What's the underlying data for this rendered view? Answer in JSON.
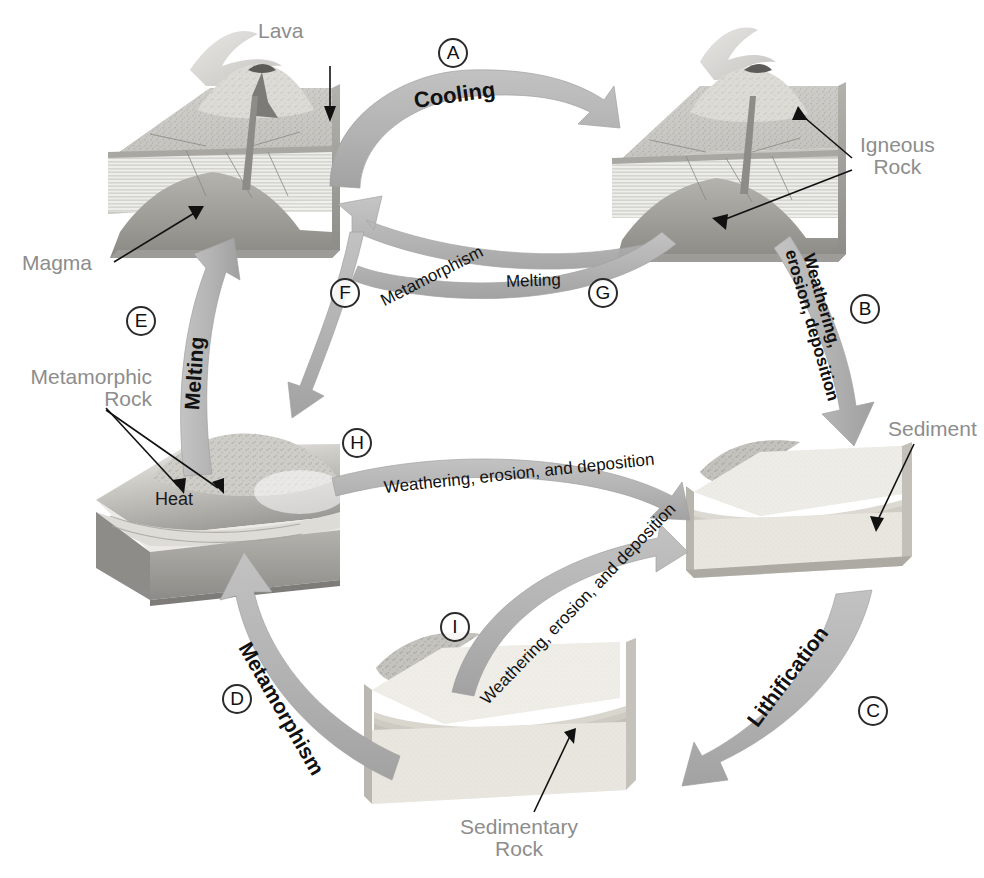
{
  "diagram": {
    "background": "#ffffff",
    "arrow_color": "#b3b3b3",
    "arrow_color_dark": "#9a9a9a",
    "label_gray": "#8d8d8d",
    "label_black": "#1a1a1a"
  },
  "blocks": [
    {
      "id": "igneous-volcano-left",
      "label": "",
      "position": "top-left"
    },
    {
      "id": "igneous-volcano-right",
      "label": "Igneous Rock",
      "position": "top-right"
    },
    {
      "id": "metamorphic-block",
      "label": "Metamorphic Rock",
      "position": "left"
    },
    {
      "id": "sediment-block",
      "label": "Sediment",
      "position": "right"
    },
    {
      "id": "sedimentary-block",
      "label": "Sedimentary Rock",
      "position": "bottom"
    }
  ],
  "labels": {
    "lava": "Lava",
    "magma": "Magma",
    "igneous_rock": "Igneous\nRock",
    "metamorphic_rock": "Metamorphic\nRock",
    "heat": "Heat",
    "sediment": "Sediment",
    "sedimentary_rock": "Sedimentary\nRock"
  },
  "arrows": [
    {
      "key": "A",
      "label": "Cooling",
      "from": "igneous-volcano-left",
      "to": "igneous-volcano-right",
      "double_headed": false
    },
    {
      "key": "B",
      "label": "Weathering,\nerosion, deposition",
      "label_line1": "Weathering,",
      "label_line2": "erosion, deposition",
      "from": "igneous-volcano-right",
      "to": "sediment-block",
      "double_headed": false
    },
    {
      "key": "C",
      "label": "Lithification",
      "from": "sediment-block",
      "to": "sedimentary-block",
      "double_headed": false
    },
    {
      "key": "D",
      "label": "Metamorphism",
      "from": "sedimentary-block",
      "to": "metamorphic-block",
      "double_headed": false
    },
    {
      "key": "E",
      "label": "Melting",
      "from": "metamorphic-block",
      "to": "igneous-volcano-left",
      "double_headed": false
    },
    {
      "key": "F",
      "label": "Metamorphism",
      "from": "igneous-volcano-right",
      "to": "metamorphic-block",
      "double_headed": true
    },
    {
      "key": "G",
      "label": "Melting",
      "from": "igneous-volcano-right",
      "to": "igneous-volcano-left",
      "double_headed": false
    },
    {
      "key": "H",
      "label": "Weathering, erosion, and deposition",
      "from": "metamorphic-block",
      "to": "sediment-block",
      "double_headed": false
    },
    {
      "key": "I",
      "label": "Weathering, erosion, and deposition",
      "from": "sedimentary-block",
      "to": "sediment-block",
      "double_headed": false
    }
  ],
  "keys": [
    "A",
    "B",
    "C",
    "D",
    "E",
    "F",
    "G",
    "H",
    "I"
  ]
}
